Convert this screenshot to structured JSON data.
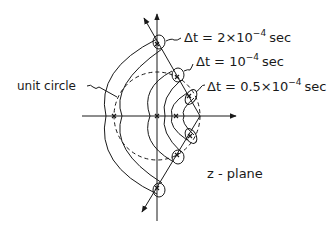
{
  "diagram": {
    "plane_label": "z - plane",
    "unit_circle_label": "unit circle",
    "curves": [
      {
        "id": "dt-2e-4",
        "label_prefix": "Δt = 2×10",
        "exponent": "−4",
        "unit": "sec"
      },
      {
        "id": "dt-1e-4",
        "label_prefix": "Δt = 10",
        "exponent": "−4",
        "unit": "sec"
      },
      {
        "id": "dt-0.5e-4",
        "label_prefix": "Δt = 0.5×10",
        "exponent": "−4",
        "unit": "sec"
      }
    ],
    "colors": {
      "ink": "#1a1a1a",
      "background": "#ffffff"
    }
  }
}
